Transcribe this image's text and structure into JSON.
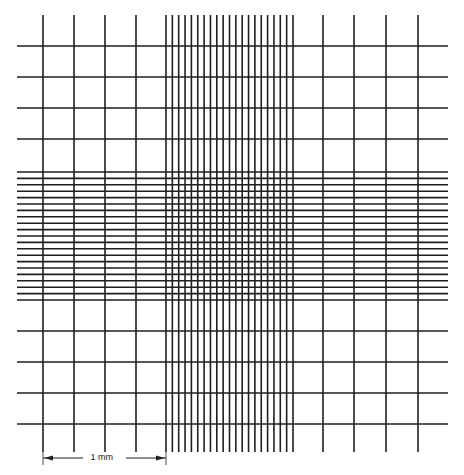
{
  "diagram": {
    "title": "",
    "line_color": "#1f1f1f",
    "background": "#ffffff",
    "extent": {
      "x_start": 17,
      "x_end": 448,
      "y_start": 15,
      "y_end": 452
    },
    "vertical_lines": {
      "left_coarse": [
        43,
        74,
        105,
        136
      ],
      "dense_start": 166,
      "dense_end": 293,
      "dense_count": 21,
      "right_coarse": [
        323,
        354,
        386,
        418
      ]
    },
    "horizontal_lines": {
      "top_coarse": [
        46,
        77,
        108,
        139
      ],
      "dense_start": 172,
      "dense_end": 300,
      "dense_count": 21,
      "bottom_coarse": [
        331,
        362,
        393,
        424
      ]
    }
  },
  "scale_bar": {
    "label": "1 mm",
    "x_start": 43,
    "x_end": 166,
    "y": 458
  }
}
